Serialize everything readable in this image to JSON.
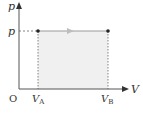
{
  "diagram": {
    "type": "p-V diagram (isobaric process)",
    "axes": {
      "y_label": "p",
      "x_label": "V",
      "origin_label": "O"
    },
    "levels": {
      "pressure_label": "p"
    },
    "points": [
      {
        "name": "A",
        "label_main": "V",
        "label_sub": "A"
      },
      {
        "name": "B",
        "label_main": "V",
        "label_sub": "B"
      }
    ],
    "process": {
      "from": "A",
      "to": "B",
      "direction": "right",
      "shaded_area_under_curve": true
    },
    "colors": {
      "axis": "#555555",
      "process_line": "#9a9a9a",
      "shading": "#f0f0f0",
      "points": "#222222",
      "dashed": "#666666"
    }
  }
}
